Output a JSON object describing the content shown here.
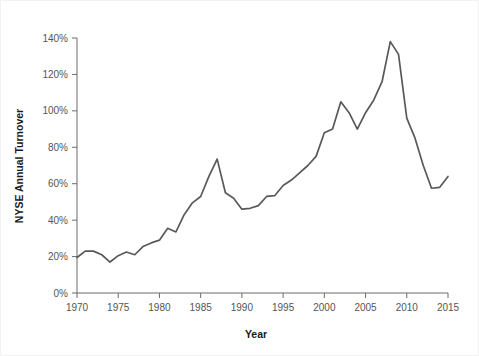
{
  "chart_data": {
    "type": "line",
    "title": "",
    "xlabel": "Year",
    "ylabel": "NYSE Annual Turnover",
    "xlim": [
      1970,
      2015
    ],
    "ylim": [
      0,
      140
    ],
    "grid": false,
    "legend": null,
    "x_tick_labels": [
      "1970",
      "1975",
      "1980",
      "1985",
      "1990",
      "1995",
      "2000",
      "2005",
      "2010",
      "2015"
    ],
    "x_ticks": [
      1970,
      1975,
      1980,
      1985,
      1990,
      1995,
      2000,
      2005,
      2010,
      2015
    ],
    "y_tick_labels": [
      "0%",
      "20%",
      "40%",
      "60%",
      "80%",
      "100%",
      "120%",
      "140%"
    ],
    "y_ticks": [
      0,
      20,
      40,
      60,
      80,
      100,
      120,
      140
    ],
    "y_unit": "%",
    "line_color": "#595959",
    "series": [
      {
        "name": "NYSE Annual Turnover",
        "x": [
          1970,
          1971,
          1972,
          1973,
          1974,
          1975,
          1976,
          1977,
          1978,
          1979,
          1980,
          1981,
          1982,
          1983,
          1984,
          1985,
          1986,
          1987,
          1988,
          1989,
          1990,
          1991,
          1992,
          1993,
          1994,
          1995,
          1996,
          1997,
          1998,
          1999,
          2000,
          2001,
          2002,
          2003,
          2004,
          2005,
          2006,
          2007,
          2008,
          2009,
          2010,
          2011,
          2012,
          2013,
          2014,
          2015
        ],
        "values": [
          19.5,
          23.0,
          23.0,
          21.0,
          17.0,
          20.5,
          22.5,
          21.0,
          25.5,
          27.5,
          29.0,
          35.5,
          33.5,
          43.0,
          49.5,
          53.0,
          64.0,
          73.5,
          55.0,
          52.0,
          46.0,
          46.5,
          48.0,
          53.0,
          53.5,
          59.0,
          62.0,
          66.0,
          70.0,
          75.0,
          88.0,
          90.0,
          105.0,
          99.0,
          90.0,
          99.0,
          106.0,
          116.0,
          138.0,
          131.0,
          96.0,
          85.0,
          70.0,
          57.5,
          58.0,
          64.0
        ]
      }
    ],
    "annotations": []
  },
  "figure": {
    "background_color": "#ffffff",
    "border_color": "#f2f2f2",
    "axis_color": "#6b6b6b",
    "tick_label_color": "#555555",
    "axis_title_color": "#1a1a1a"
  }
}
